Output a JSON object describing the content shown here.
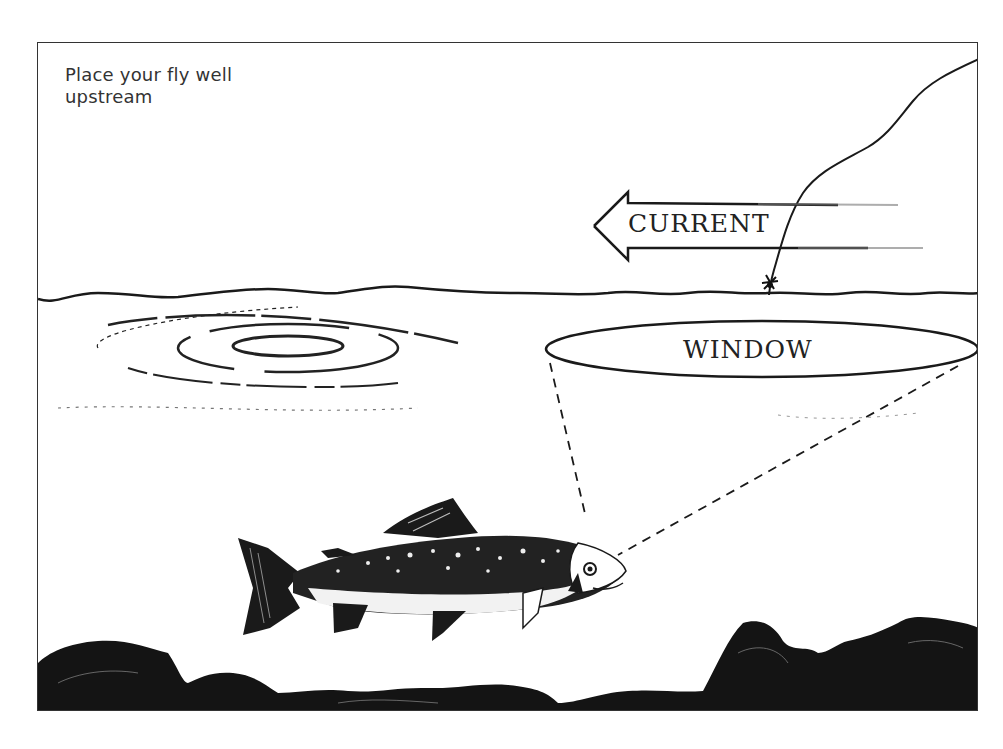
{
  "illustration": {
    "caption": "Place your fly well upstream",
    "caption_lines": [
      "Place your fly well",
      "upstream"
    ],
    "labels": {
      "current": "CURRENT",
      "window": "WINDOW"
    },
    "elements": [
      "fishing-line",
      "fly",
      "current-arrow",
      "water-surface",
      "rise-rings",
      "window-ellipse",
      "sight-lines",
      "trout",
      "riverbed-rocks"
    ],
    "colors": {
      "ink": "#1a1a1a",
      "background": "#ffffff"
    }
  }
}
